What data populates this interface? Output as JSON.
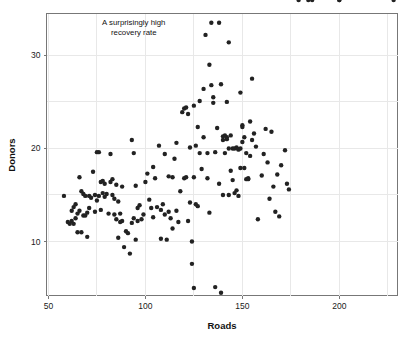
{
  "chart_data": {
    "type": "scatter",
    "title": "",
    "xlabel": "Roads",
    "ylabel": "Donors",
    "xlim": [
      49,
      230
    ],
    "ylim": [
      4.2,
      34.5
    ],
    "xticks": [
      50,
      100,
      150,
      200
    ],
    "yticks": [
      10,
      20,
      30
    ],
    "xtick_labels": [
      "50",
      "100",
      "150",
      "200"
    ],
    "ytick_labels": [
      "10",
      "20",
      "30"
    ],
    "grid": true,
    "grid_axes": "both",
    "legend": "none",
    "point_color": "#222222",
    "point_size": 2.2,
    "annotations": [
      {
        "name": "outlier-callout",
        "lines": [
          "A surprisingly high",
          "recovery rate"
        ],
        "x": 94,
        "y": 33.3
      }
    ],
    "x": [
      58,
      60,
      61,
      62,
      62,
      63,
      63,
      64,
      64,
      65,
      65,
      66,
      66,
      67,
      67,
      68,
      68,
      69,
      69,
      70,
      70,
      71,
      71,
      72,
      73,
      74,
      74,
      75,
      75,
      76,
      76,
      77,
      77,
      78,
      78,
      79,
      79,
      80,
      81,
      82,
      82,
      83,
      83,
      84,
      84,
      85,
      85,
      86,
      86,
      87,
      87,
      88,
      88,
      89,
      90,
      91,
      92,
      93,
      93,
      94,
      94,
      95,
      95,
      96,
      96,
      97,
      98,
      99,
      100,
      101,
      102,
      103,
      104,
      104,
      105,
      106,
      107,
      108,
      108,
      109,
      110,
      110,
      111,
      112,
      112,
      113,
      114,
      114,
      115,
      116,
      116,
      117,
      118,
      119,
      120,
      120,
      121,
      121,
      122,
      122,
      123,
      123,
      124,
      124,
      125,
      125,
      125,
      126,
      126,
      127,
      127,
      128,
      128,
      129,
      130,
      130,
      131,
      132,
      132,
      133,
      133,
      134,
      134,
      135,
      135,
      136,
      136,
      137,
      138,
      138,
      139,
      139,
      140,
      140,
      140,
      141,
      141,
      142,
      142,
      142,
      143,
      143,
      143,
      144,
      144,
      145,
      145,
      146,
      146,
      147,
      147,
      148,
      148,
      148,
      149,
      149,
      149,
      150,
      150,
      150,
      151,
      151,
      152,
      152,
      153,
      153,
      154,
      154,
      155,
      155,
      156,
      157,
      158,
      160,
      161,
      162,
      163,
      164,
      165,
      166,
      167,
      168,
      169,
      170,
      172,
      173,
      174,
      179,
      184,
      186,
      200,
      200,
      228
    ],
    "y": [
      14.9,
      12.1,
      11.9,
      13.3,
      12.2,
      13.7,
      11.9,
      14.0,
      12.5,
      13.0,
      11.0,
      16.9,
      13.3,
      15.4,
      11.0,
      15.1,
      12.8,
      14.9,
      12.8,
      13.1,
      10.5,
      14.9,
      13.6,
      14.7,
      17.5,
      15.0,
      13.2,
      19.6,
      14.4,
      19.6,
      14.9,
      16.4,
      13.4,
      16.5,
      15.2,
      16.2,
      14.8,
      15.1,
      13.0,
      19.4,
      16.4,
      16.7,
      15.0,
      14.6,
      12.9,
      16.1,
      12.4,
      14.3,
      10.4,
      13.0,
      12.1,
      15.9,
      12.2,
      9.4,
      11.1,
      10.9,
      8.7,
      20.9,
      12.0,
      19.5,
      12.5,
      16.0,
      10.2,
      13.6,
      12.2,
      13.9,
      12.4,
      12.9,
      16.4,
      17.3,
      14.5,
      13.6,
      18.0,
      12.6,
      16.8,
      13.7,
      20.3,
      13.4,
      10.3,
      14.0,
      19.4,
      12.9,
      10.2,
      17.0,
      13.2,
      12.5,
      16.9,
      11.4,
      18.9,
      20.6,
      13.3,
      12.1,
      15.4,
      23.9,
      24.3,
      16.8,
      24.4,
      16.9,
      23.7,
      12.2,
      20.1,
      14.2,
      10.0,
      7.6,
      24.6,
      16.9,
      5.0,
      20.3,
      14.0,
      13.8,
      22.3,
      19.5,
      25.1,
      17.8,
      26.4,
      21.2,
      32.2,
      16.8,
      19.5,
      13.1,
      29.0,
      26.8,
      33.5,
      25.5,
      24.9,
      19.6,
      5.1,
      22.2,
      16.2,
      33.5,
      26.9,
      4.5,
      20.9,
      21.3,
      15.0,
      19.5,
      21.4,
      21.0,
      25.0,
      21.2,
      15.0,
      31.4,
      20.0,
      21.4,
      17.6,
      20.0,
      16.6,
      20.0,
      15.2,
      20.1,
      15.5,
      19.9,
      19.9,
      14.9,
      20.0,
      17.9,
      26.0,
      22.3,
      20.7,
      22.5,
      21.2,
      17.9,
      19.5,
      16.7,
      16.8,
      16.7,
      22.9,
      19.2,
      20.9,
      27.5,
      21.6,
      20.2,
      12.4,
      17.1,
      19.4,
      22.1,
      18.5,
      14.6,
      21.8,
      15.9,
      13.2,
      17.2,
      12.7,
      18.2,
      19.8,
      16.2,
      15.6
    ]
  },
  "axes": {
    "x_title": "Roads",
    "y_title": "Donors"
  }
}
